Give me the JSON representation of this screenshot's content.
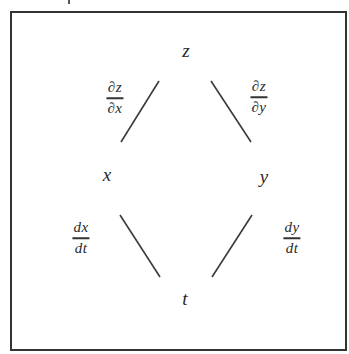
{
  "diagram": {
    "nodes": {
      "top": "z",
      "middle_left": "x",
      "middle_right": "y",
      "bottom": "t"
    },
    "edge_labels": {
      "z_to_x": {
        "numerator": "∂z",
        "denominator": "∂x"
      },
      "z_to_y": {
        "numerator": "∂z",
        "denominator": "∂y"
      },
      "x_to_t": {
        "numerator": "dx",
        "denominator": "dt"
      },
      "y_to_t": {
        "numerator": "dy",
        "denominator": "dt"
      }
    },
    "edges": [
      {
        "from": "z",
        "to": "x"
      },
      {
        "from": "z",
        "to": "y"
      },
      {
        "from": "x",
        "to": "t"
      },
      {
        "from": "y",
        "to": "t"
      }
    ],
    "colors": {
      "ink": "#333333",
      "background": "#ffffff"
    }
  }
}
